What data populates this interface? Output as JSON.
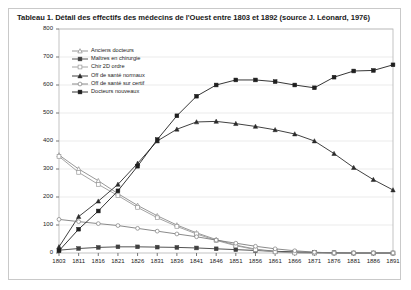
{
  "chart_data": {
    "type": "line",
    "title": "Tableau 1. Détail des effectifs des médecins de l'Ouest entre 1803 et 1892 (source J. Léonard, 1976)",
    "xlabel": "",
    "ylabel": "",
    "ylim": [
      0,
      800
    ],
    "yticks": [
      0,
      100,
      200,
      300,
      400,
      500,
      600,
      700,
      800
    ],
    "grid": true,
    "legend_position": "upper-left-inside",
    "categories": [
      "1803",
      "1811",
      "1816",
      "1821",
      "1826",
      "1831",
      "1836",
      "1841",
      "1846",
      "1851",
      "1856",
      "1861",
      "1866",
      "1871",
      "1876",
      "1881",
      "1886",
      "1891"
    ],
    "series": [
      {
        "name": "Anciens docteurs",
        "marker": "triangle-open",
        "color": "#8c8c8c",
        "values": [
          350,
          300,
          258,
          212,
          170,
          133,
          100,
          72,
          48,
          28,
          14,
          6,
          2,
          0,
          0,
          0,
          0,
          0
        ]
      },
      {
        "name": "Maîtres en chirurgie",
        "marker": "square-filled",
        "color": "#404040",
        "values": [
          10,
          16,
          20,
          22,
          22,
          21,
          20,
          18,
          15,
          12,
          9,
          6,
          4,
          2,
          1,
          0,
          0,
          0
        ]
      },
      {
        "name": "Chir 2D ordre",
        "marker": "square-open",
        "color": "#9a9a9a",
        "values": [
          345,
          288,
          245,
          205,
          163,
          126,
          95,
          68,
          45,
          26,
          12,
          4,
          0,
          0,
          0,
          0,
          0,
          0
        ]
      },
      {
        "name": "Off de santé normaux",
        "marker": "triangle-filled",
        "color": "#2b2b2b",
        "values": [
          22,
          130,
          185,
          245,
          320,
          400,
          442,
          468,
          470,
          462,
          452,
          440,
          425,
          400,
          355,
          305,
          262,
          225
        ]
      },
      {
        "name": "Off de santé sur certif",
        "marker": "circle-open",
        "color": "#7d7d7d",
        "values": [
          120,
          112,
          105,
          98,
          88,
          78,
          68,
          58,
          46,
          35,
          24,
          15,
          8,
          3,
          0,
          0,
          0,
          0
        ]
      },
      {
        "name": "Docteurs nouveaux",
        "marker": "square-filled",
        "color": "#1f1f1f",
        "values": [
          8,
          85,
          150,
          222,
          310,
          405,
          490,
          560,
          600,
          618,
          618,
          612,
          600,
          590,
          628,
          650,
          652,
          672
        ]
      }
    ]
  }
}
